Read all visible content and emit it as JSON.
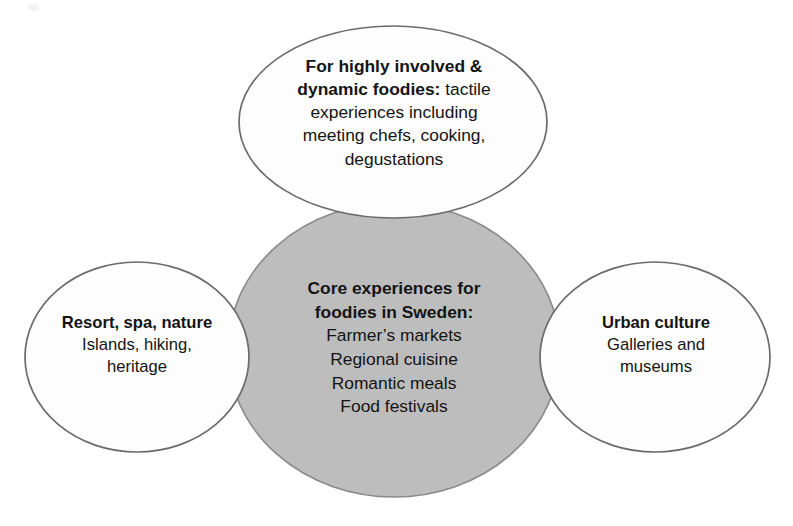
{
  "diagram": {
    "type": "venn-overlap-diagram",
    "shape_count": 4,
    "colors": {
      "center_fill": "#bdbdbd",
      "outer_fill": "#fdfdfd",
      "outline": "#6b6b6b",
      "text": "#141414",
      "background": "#ffffff"
    },
    "center": {
      "name": "core-experiences",
      "title_line_1": "Core experiences for",
      "title_line_2": "foodies in Sweden:",
      "items": [
        "Farmer’s markets",
        "Regional cuisine",
        "Romantic meals",
        "Food festivals"
      ]
    },
    "top": {
      "name": "highly-involved-dynamic-foodies",
      "title": "For highly involved &",
      "title_continued": "dynamic foodies:",
      "body_first_line": " tactile",
      "body_lines": [
        "experiences including",
        "meeting chefs, cooking,",
        "degustations"
      ]
    },
    "left": {
      "name": "resort-spa-nature",
      "title": "Resort, spa, nature",
      "body_lines": [
        "Islands, hiking,",
        "heritage"
      ]
    },
    "right": {
      "name": "urban-culture",
      "title": "Urban culture",
      "body_lines": [
        "Galleries and",
        "museums"
      ]
    }
  }
}
